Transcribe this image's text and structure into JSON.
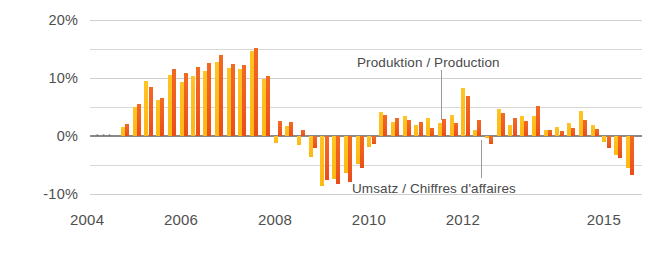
{
  "chart_data": {
    "type": "bar",
    "title": "",
    "subtitle": "",
    "xlabel": "",
    "ylabel": "",
    "ylim": [
      -12,
      21
    ],
    "ytick_values": [
      20,
      10,
      0,
      -10
    ],
    "ytick_labels": [
      "20%",
      "10%",
      "0%",
      "-10%"
    ],
    "gridlines": [
      20,
      15,
      10,
      5,
      0,
      -5,
      -10
    ],
    "grid": true,
    "zero_line": 0,
    "xtick_labels": [
      "2004",
      "2006",
      "2008",
      "2010",
      "2012",
      "2015"
    ],
    "xtick_values": [
      2004,
      2006,
      2008,
      2010,
      2012,
      2015
    ],
    "xlim": [
      2004.0,
      2015.75
    ],
    "legend_position": "inline-annotation",
    "continuation_marker": "...",
    "series": [
      {
        "name": "Produktion / Production",
        "color": "#ef5a20",
        "values": [
          2.1,
          5.6,
          8.4,
          6.6,
          11.6,
          10.8,
          11.9,
          12.6,
          13.9,
          12.4,
          12.2,
          15.1,
          10.3,
          2.6,
          2.4,
          1.0,
          -2.0,
          -7.5,
          -8.2,
          -7.9,
          -5.4,
          -1.3,
          3.6,
          3.2,
          2.8,
          2.5,
          1.4,
          3.0,
          2.3,
          6.9,
          2.8,
          -1.4,
          3.9,
          3.1,
          2.6,
          5.2,
          1.1,
          0.9,
          1.4,
          2.7,
          1.2,
          -2.1,
          -3.8,
          -6.6
        ]
      },
      {
        "name": "Umsatz / Chiffres d'affaires",
        "color": "#fdb813",
        "values": [
          1.6,
          5.1,
          9.4,
          6.2,
          10.5,
          9.3,
          10.4,
          11.2,
          12.7,
          11.8,
          11.5,
          14.6,
          9.8,
          -1.2,
          1.8,
          -1.6,
          -3.6,
          -8.6,
          -7.3,
          -6.4,
          -4.7,
          -1.8,
          4.2,
          2.4,
          3.4,
          1.9,
          3.1,
          2.2,
          3.7,
          8.2,
          1.0,
          -0.3,
          4.6,
          2.0,
          3.4,
          3.5,
          1.0,
          1.6,
          2.3,
          4.3,
          2.0,
          -1.0,
          -3.2,
          -5.4
        ]
      }
    ],
    "periods": [
      "2004Q4",
      "2005Q1",
      "2005Q2",
      "2005Q3",
      "2005Q4",
      "2006Q1",
      "2006Q2",
      "2006Q3",
      "2006Q4",
      "2007Q1",
      "2007Q2",
      "2007Q3",
      "2007Q4",
      "2008Q1",
      "2008Q2",
      "2008Q3",
      "2008Q4",
      "2009Q1",
      "2009Q2",
      "2009Q3",
      "2009Q4",
      "2010Q1",
      "2010Q2",
      "2010Q3",
      "2010Q4",
      "2011Q1",
      "2011Q2",
      "2011Q3",
      "2011Q4",
      "2012Q1",
      "2012Q2",
      "2012Q3",
      "2012Q4",
      "2013Q1",
      "2013Q2",
      "2013Q3",
      "2013Q4",
      "2014Q1",
      "2014Q2",
      "2014Q3",
      "2014Q4",
      "2015Q1",
      "2015Q2",
      "2015Q3",
      "2015Q4"
    ],
    "annotations": [
      {
        "id": "production",
        "text": "Produktion / Production",
        "label_x_px": 357,
        "label_y_px": 56,
        "leader_x_px": 441,
        "leader_top_px": 70,
        "leader_bottom_px": 120
      },
      {
        "id": "sales",
        "text": "Umsatz / Chiffres d'affaires",
        "label_x_px": 352,
        "label_y_px": 182,
        "leader_x_px": 481,
        "leader_top_px": 140,
        "leader_bottom_px": 178
      }
    ]
  },
  "colors": {
    "production": "#ef5a20",
    "sales": "#fdb813",
    "grid": "#d8d8d8",
    "zero_axis": "#8a8a8a",
    "text": "#4a4a4a",
    "background": "#ffffff"
  }
}
